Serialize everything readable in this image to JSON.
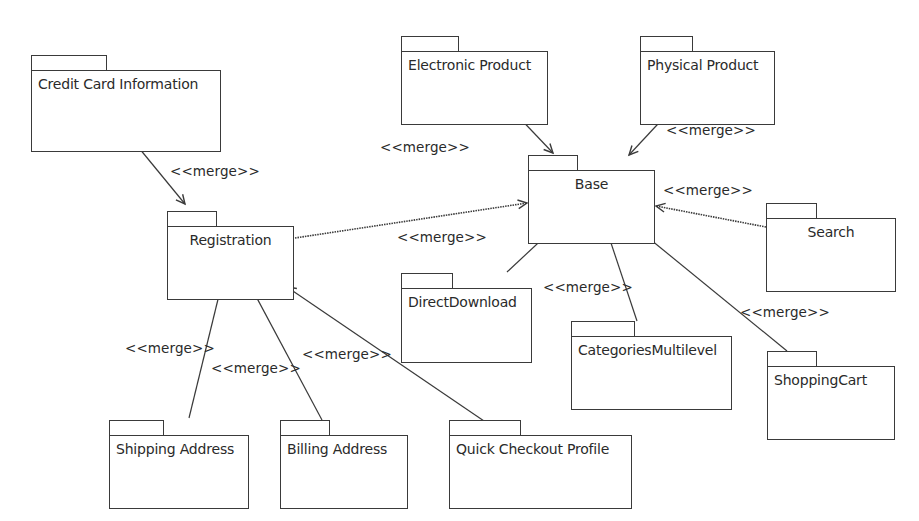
{
  "diagram": {
    "type": "UML package diagram",
    "packages": [
      {
        "id": "credit_card_information",
        "name": "Credit Card Information",
        "x": 31,
        "y": 55,
        "w": 190,
        "h": 82,
        "tab_w": 76,
        "centered": false
      },
      {
        "id": "registration",
        "name": "Registration",
        "x": 167,
        "y": 211,
        "w": 127,
        "h": 74,
        "tab_w": 50,
        "centered": true
      },
      {
        "id": "electronic_product",
        "name": "Electronic Product",
        "x": 401,
        "y": 36,
        "w": 147,
        "h": 74,
        "tab_w": 58,
        "centered": false
      },
      {
        "id": "physical_product",
        "name": "Physical Product",
        "x": 640,
        "y": 36,
        "w": 135,
        "h": 74,
        "tab_w": 53,
        "centered": false
      },
      {
        "id": "base",
        "name": "Base",
        "x": 528,
        "y": 155,
        "w": 127,
        "h": 74,
        "tab_w": 50,
        "centered": true
      },
      {
        "id": "search",
        "name": "Search",
        "x": 766,
        "y": 203,
        "w": 130,
        "h": 74,
        "tab_w": 51,
        "centered": true
      },
      {
        "id": "direct_download",
        "name": "DirectDownload",
        "x": 401,
        "y": 273,
        "w": 131,
        "h": 75,
        "tab_w": 52,
        "centered": false
      },
      {
        "id": "categories_multilevel",
        "name": "CategoriesMultilevel",
        "x": 571,
        "y": 321,
        "w": 161,
        "h": 74,
        "tab_w": 64,
        "centered": false
      },
      {
        "id": "shopping_cart",
        "name": "ShoppingCart",
        "x": 767,
        "y": 351,
        "w": 128,
        "h": 74,
        "tab_w": 50,
        "centered": false
      },
      {
        "id": "shipping_address",
        "name": "Shipping Address",
        "x": 109,
        "y": 420,
        "w": 140,
        "h": 74,
        "tab_w": 55,
        "centered": false
      },
      {
        "id": "billing_address",
        "name": "Billing Address",
        "x": 280,
        "y": 420,
        "w": 128,
        "h": 74,
        "tab_w": 50,
        "centered": false
      },
      {
        "id": "quick_checkout_profile",
        "name": "Quick Checkout Profile",
        "x": 449,
        "y": 420,
        "w": 183,
        "h": 74,
        "tab_w": 72,
        "centered": false
      }
    ],
    "relations": [
      {
        "from": "credit_card_information",
        "to": "registration",
        "stereotype": "<<merge>>",
        "style": "solid",
        "x1": 130,
        "y1": 137,
        "x2": 185,
        "y2": 204,
        "label_x": 170,
        "label_y": 163
      },
      {
        "from": "electronic_product",
        "to": "base",
        "stereotype": "<<merge>>",
        "style": "solid",
        "x1": 513,
        "y1": 111,
        "x2": 553,
        "y2": 153,
        "label_x": 380,
        "label_y": 139
      },
      {
        "from": "physical_product",
        "to": "base",
        "stereotype": "<<merge>>",
        "style": "solid",
        "x1": 670,
        "y1": 111,
        "x2": 629,
        "y2": 155,
        "label_x": 666,
        "label_y": 122
      },
      {
        "from": "registration",
        "to": "base",
        "stereotype": "<<merge>>",
        "style": "dotted",
        "x1": 295,
        "y1": 238,
        "x2": 527,
        "y2": 203,
        "label_x": 397,
        "label_y": 229
      },
      {
        "from": "search",
        "to": "base",
        "stereotype": "<<merge>>",
        "style": "dotted",
        "x1": 766,
        "y1": 227,
        "x2": 656,
        "y2": 206,
        "label_x": 663,
        "label_y": 182
      },
      {
        "from": "direct_download",
        "to": "base",
        "stereotype": "<<merge>>",
        "style": "solid",
        "x1": 507,
        "y1": 272,
        "x2": 551,
        "y2": 231,
        "label_x": 397,
        "label_y": 229
      },
      {
        "from": "categories_multilevel",
        "to": "base",
        "stereotype": "<<merge>>",
        "style": "solid",
        "x1": 637,
        "y1": 321,
        "x2": 607,
        "y2": 231,
        "label_x": 543,
        "label_y": 279
      },
      {
        "from": "shopping_cart",
        "to": "base",
        "stereotype": "<<merge>>",
        "style": "solid",
        "x1": 787,
        "y1": 351,
        "x2": 640,
        "y2": 231,
        "label_x": 740,
        "label_y": 304
      },
      {
        "from": "shipping_address",
        "to": "registration",
        "stereotype": "<<merge>>",
        "style": "solid",
        "x1": 189,
        "y1": 418,
        "x2": 221,
        "y2": 287,
        "label_x": 125,
        "label_y": 340
      },
      {
        "from": "billing_address",
        "to": "registration",
        "stereotype": "<<merge>>",
        "style": "solid",
        "x1": 322,
        "y1": 420,
        "x2": 251,
        "y2": 287,
        "label_x": 211,
        "label_y": 360
      },
      {
        "from": "quick_checkout_profile",
        "to": "registration",
        "stereotype": "<<merge>>",
        "style": "solid",
        "x1": 484,
        "y1": 421,
        "x2": 287,
        "y2": 287,
        "label_x": 302,
        "label_y": 346
      }
    ],
    "labels": [
      {
        "text": "<<merge>>",
        "x": 170,
        "y": 163
      },
      {
        "text": "<<merge>>",
        "x": 380,
        "y": 139
      },
      {
        "text": "<<merge>>",
        "x": 666,
        "y": 122
      },
      {
        "text": "<<merge>>",
        "x": 663,
        "y": 182
      },
      {
        "text": "<<merge>>",
        "x": 397,
        "y": 229
      },
      {
        "text": "<<merge>>",
        "x": 543,
        "y": 279
      },
      {
        "text": "<<merge>>",
        "x": 740,
        "y": 304
      },
      {
        "text": "<<merge>>",
        "x": 125,
        "y": 340
      },
      {
        "text": "<<merge>>",
        "x": 211,
        "y": 360
      },
      {
        "text": "<<merge>>",
        "x": 302,
        "y": 346
      }
    ],
    "colors": {
      "background": "#ffffff",
      "stroke": "#3a3a3a",
      "text": "#2a2a2a"
    }
  }
}
